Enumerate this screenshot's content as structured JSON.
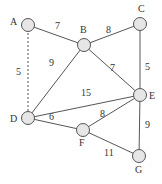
{
  "diagram": {
    "type": "weighted-graph",
    "nodes": [
      {
        "id": "A",
        "label": "A",
        "x": 28,
        "y": 25,
        "lx": 10,
        "ly": 25
      },
      {
        "id": "B",
        "label": "B",
        "x": 84,
        "y": 45,
        "lx": 80,
        "ly": 33
      },
      {
        "id": "C",
        "label": "C",
        "x": 140,
        "y": 24,
        "lx": 138,
        "ly": 12
      },
      {
        "id": "D",
        "label": "D",
        "x": 28,
        "y": 118,
        "lx": 10,
        "ly": 122
      },
      {
        "id": "E",
        "label": "E",
        "x": 140,
        "y": 95,
        "lx": 149,
        "ly": 99
      },
      {
        "id": "F",
        "label": "F",
        "x": 83,
        "y": 130,
        "lx": 79,
        "ly": 146
      },
      {
        "id": "G",
        "label": "G",
        "x": 139,
        "y": 156,
        "lx": 135,
        "ly": 173
      }
    ],
    "edges": [
      {
        "from": "A",
        "to": "B",
        "weight": "7",
        "dashed": false,
        "wx": 55,
        "wy": 29
      },
      {
        "from": "A",
        "to": "D",
        "weight": "5",
        "dashed": true,
        "wx": 16,
        "wy": 75
      },
      {
        "from": "B",
        "to": "C",
        "weight": "8",
        "dashed": false,
        "wx": 106,
        "wy": 33
      },
      {
        "from": "B",
        "to": "D",
        "weight": "9",
        "dashed": false,
        "wx": 49,
        "wy": 66
      },
      {
        "from": "B",
        "to": "E",
        "weight": "7",
        "dashed": false,
        "wx": 110,
        "wy": 71
      },
      {
        "from": "C",
        "to": "E",
        "weight": "5",
        "dashed": false,
        "wx": 145,
        "wy": 70
      },
      {
        "from": "D",
        "to": "E",
        "weight": "15",
        "dashed": false,
        "wx": 81,
        "wy": 96
      },
      {
        "from": "D",
        "to": "F",
        "weight": "6",
        "dashed": false,
        "wx": 49,
        "wy": 120
      },
      {
        "from": "E",
        "to": "F",
        "weight": "8",
        "dashed": false,
        "wx": 100,
        "wy": 117
      },
      {
        "from": "E",
        "to": "G",
        "weight": "9",
        "dashed": false,
        "wx": 145,
        "wy": 128
      },
      {
        "from": "F",
        "to": "G",
        "weight": "11",
        "dashed": false,
        "wx": 104,
        "wy": 156
      }
    ]
  },
  "colors": {
    "line": "#555555",
    "node_fill": "#e6e6e6",
    "text": "#333333"
  }
}
